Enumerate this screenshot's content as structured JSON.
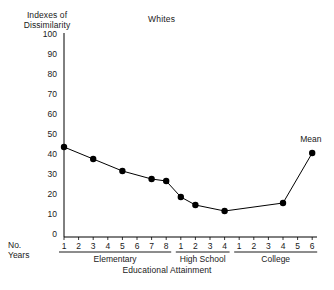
{
  "chart_title": "Whites",
  "y_axis_header": "Indexes of\nDissimilarity",
  "y_axis_header_line1": "Indexes of",
  "y_axis_header_line2": "Dissimilarity",
  "x_axis_title": "Educational Attainment",
  "no_years_line1": "No.",
  "no_years_line2": "Years",
  "mean_annotation": "Mean",
  "chart_data": {
    "type": "line",
    "title": "Whites",
    "xlabel": "Educational Attainment",
    "ylabel": "Indexes of Dissimilarity",
    "ylim": [
      0,
      100
    ],
    "ytick_labels": [
      "0",
      "10",
      "20",
      "30",
      "40",
      "50",
      "60",
      "70",
      "80",
      "90",
      "100"
    ],
    "ytick_values": [
      0,
      10,
      20,
      30,
      40,
      50,
      60,
      70,
      80,
      90,
      100
    ],
    "grid": false,
    "legend": "none",
    "marker": "filled-circle",
    "line_color": "#000000",
    "marker_color": "#000000",
    "x_groups": [
      {
        "name": "Elementary",
        "ticks": [
          "1",
          "2",
          "3",
          "4",
          "5",
          "6",
          "7",
          "8"
        ]
      },
      {
        "name": "High School",
        "ticks": [
          "1",
          "2",
          "3",
          "4"
        ]
      },
      {
        "name": "College",
        "ticks": [
          "1",
          "2",
          "3",
          "4",
          "5",
          "6"
        ]
      }
    ],
    "x_tick_labels": [
      "1",
      "2",
      "3",
      "4",
      "5",
      "6",
      "7",
      "8",
      "1",
      "2",
      "3",
      "4",
      "1",
      "2",
      "3",
      "4",
      "5",
      "6"
    ],
    "points": [
      {
        "group": "Elementary",
        "year": "1",
        "index": 0,
        "value": 44
      },
      {
        "group": "Elementary",
        "year": "3",
        "index": 2,
        "value": 38
      },
      {
        "group": "Elementary",
        "year": "5",
        "index": 4,
        "value": 32
      },
      {
        "group": "Elementary",
        "year": "7",
        "index": 6,
        "value": 28
      },
      {
        "group": "Elementary",
        "year": "8",
        "index": 7,
        "value": 27
      },
      {
        "group": "High School",
        "year": "1",
        "index": 8,
        "value": 19
      },
      {
        "group": "High School",
        "year": "2",
        "index": 9,
        "value": 15
      },
      {
        "group": "High School",
        "year": "4",
        "index": 11,
        "value": 12
      },
      {
        "group": "College",
        "year": "4",
        "index": 15,
        "value": 16
      },
      {
        "group": "College",
        "year": "6",
        "index": 17,
        "value": 41,
        "annotation": "Mean"
      }
    ],
    "values": [
      44,
      38,
      32,
      28,
      27,
      19,
      15,
      12,
      16,
      41
    ]
  }
}
